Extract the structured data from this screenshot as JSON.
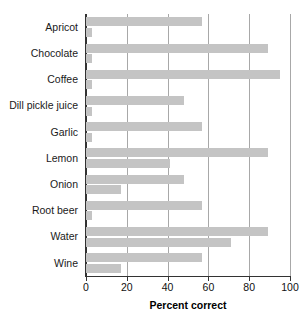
{
  "chart_data": {
    "type": "bar",
    "orientation": "horizontal",
    "title": "",
    "xlabel": "Percent correct",
    "ylabel": "",
    "xlim": [
      0,
      100
    ],
    "xticks": [
      0,
      20,
      40,
      60,
      80,
      100
    ],
    "grid": true,
    "gridlines_at": [
      20,
      40,
      60,
      80,
      100
    ],
    "legend": "none",
    "bar_color": "#c4c4c4",
    "axis_color": "#333333",
    "categories": [
      "Apricot",
      "Chocolate",
      "Coffee",
      "Dill pickle juice",
      "Garlic",
      "Lemon",
      "Onion",
      "Root beer",
      "Water",
      "Wine"
    ],
    "series": [
      {
        "name": "upper",
        "values": [
          57,
          89,
          95,
          48,
          57,
          89,
          48,
          57,
          89,
          57
        ]
      },
      {
        "name": "lower",
        "values": [
          3,
          3,
          3,
          3,
          3,
          41,
          17,
          3,
          71,
          17
        ]
      }
    ]
  }
}
